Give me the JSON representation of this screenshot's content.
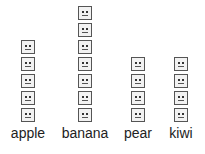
{
  "chart_data": {
    "type": "pictograph",
    "title": "",
    "xlabel": "",
    "ylabel": "",
    "categories": [
      "apple",
      "banana",
      "pear",
      "kiwi"
    ],
    "values": [
      5,
      7,
      4,
      4
    ],
    "icon": "neutral-face-square",
    "grid": false,
    "legend": null
  },
  "labels": {
    "apple": "apple",
    "banana": "banana",
    "pear": "pear",
    "kiwi": "kiwi"
  },
  "colors": {
    "icon_border": "#555555",
    "icon_fill": "#f2f2f2",
    "text": "#222222"
  }
}
